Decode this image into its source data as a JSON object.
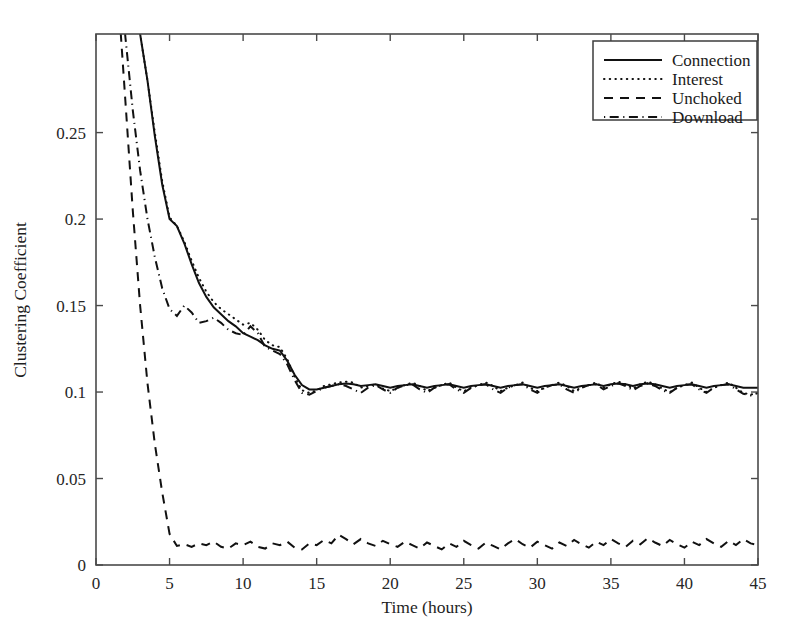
{
  "figure": {
    "background": "#ffffff",
    "ink_color": "#111111",
    "frame_color": "#4a4a4a"
  },
  "axes": {
    "x_title": "Time (hours)",
    "y_title": "Clustering Coefficient",
    "x_ticks": [
      "0",
      "5",
      "10",
      "15",
      "20",
      "25",
      "30",
      "35",
      "40",
      "45"
    ],
    "y_ticks": [
      "0",
      "0.05",
      "0.1",
      "0.15",
      "0.2",
      "0.25"
    ]
  },
  "legend": {
    "entries": [
      {
        "label": "Connection",
        "style": "solid"
      },
      {
        "label": "Interest",
        "style": "dotted"
      },
      {
        "label": "Unchoked",
        "style": "dashed"
      },
      {
        "label": "Download",
        "style": "dashdot"
      }
    ]
  },
  "chart_data": {
    "type": "line",
    "title": "",
    "xlabel": "Time (hours)",
    "ylabel": "Clustering Coefficient",
    "xlim": [
      0,
      45
    ],
    "ylim": [
      0,
      0.307
    ],
    "xticks": [
      0,
      5,
      10,
      15,
      20,
      25,
      30,
      35,
      40,
      45
    ],
    "yticks": [
      0,
      0.05,
      0.1,
      0.15,
      0.2,
      0.25
    ],
    "grid": false,
    "legend_position": "upper right",
    "x": [
      0.0,
      0.5,
      1.0,
      1.5,
      2.0,
      2.5,
      3.0,
      3.5,
      4.0,
      4.5,
      5.0,
      5.5,
      6.0,
      6.5,
      7.0,
      7.5,
      8.0,
      8.5,
      9.0,
      9.5,
      10.0,
      10.5,
      11.0,
      11.5,
      12.0,
      12.5,
      13.0,
      13.5,
      14.0,
      14.5,
      15.0,
      15.5,
      16.0,
      16.5,
      17.0,
      17.5,
      18.0,
      18.5,
      19.0,
      19.5,
      20.0,
      20.5,
      21.0,
      21.5,
      22.0,
      22.5,
      23.0,
      23.5,
      24.0,
      24.5,
      25.0,
      25.5,
      26.0,
      26.5,
      27.0,
      27.5,
      28.0,
      28.5,
      29.0,
      29.5,
      30.0,
      30.5,
      31.0,
      31.5,
      32.0,
      32.5,
      33.0,
      33.5,
      34.0,
      34.5,
      35.0,
      35.5,
      36.0,
      36.5,
      37.0,
      37.5,
      38.0,
      38.5,
      39.0,
      39.5,
      40.0,
      40.5,
      41.0,
      41.5,
      42.0,
      42.5,
      43.0,
      43.5,
      44.0,
      44.5,
      45.0
    ],
    "series": [
      {
        "name": "Connection",
        "style": "solid",
        "values": [
          0.5,
          0.46,
          0.42,
          0.385,
          0.352,
          0.33,
          0.307,
          0.28,
          0.248,
          0.22,
          0.2,
          0.196,
          0.186,
          0.174,
          0.163,
          0.155,
          0.149,
          0.145,
          0.141,
          0.138,
          0.134,
          0.132,
          0.13,
          0.127,
          0.125,
          0.124,
          0.118,
          0.11,
          0.104,
          0.1015,
          0.1015,
          0.1025,
          0.1035,
          0.1045,
          0.105,
          0.1045,
          0.1035,
          0.104,
          0.1045,
          0.1035,
          0.1025,
          0.1035,
          0.104,
          0.1045,
          0.1035,
          0.1025,
          0.1035,
          0.104,
          0.1045,
          0.1035,
          0.1025,
          0.1035,
          0.104,
          0.1045,
          0.1035,
          0.1025,
          0.1035,
          0.104,
          0.1045,
          0.1035,
          0.1025,
          0.1035,
          0.104,
          0.1045,
          0.1035,
          0.1025,
          0.1035,
          0.104,
          0.1045,
          0.1035,
          0.1045,
          0.105,
          0.1045,
          0.1035,
          0.1045,
          0.105,
          0.1045,
          0.1035,
          0.1025,
          0.1035,
          0.104,
          0.1045,
          0.1035,
          0.1025,
          0.1035,
          0.104,
          0.1045,
          0.1035,
          0.1025,
          0.1025,
          0.1025
        ]
      },
      {
        "name": "Interest",
        "style": "dotted",
        "values": [
          0.5,
          0.46,
          0.42,
          0.385,
          0.352,
          0.33,
          0.307,
          0.28,
          0.25,
          0.222,
          0.201,
          0.196,
          0.187,
          0.176,
          0.166,
          0.158,
          0.152,
          0.148,
          0.145,
          0.142,
          0.139,
          0.14,
          0.136,
          0.13,
          0.127,
          0.126,
          0.119,
          0.109,
          0.101,
          0.0995,
          0.101,
          0.1035,
          0.1045,
          0.1055,
          0.106,
          0.1055,
          0.1025,
          0.1035,
          0.1045,
          0.102,
          0.1005,
          0.1025,
          0.104,
          0.1055,
          0.1035,
          0.1005,
          0.1025,
          0.104,
          0.1055,
          0.1025,
          0.1005,
          0.1025,
          0.104,
          0.1055,
          0.1035,
          0.1005,
          0.1025,
          0.104,
          0.1055,
          0.1025,
          0.1005,
          0.1025,
          0.104,
          0.1055,
          0.1035,
          0.1005,
          0.1025,
          0.104,
          0.1055,
          0.1025,
          0.1045,
          0.106,
          0.1045,
          0.102,
          0.1045,
          0.106,
          0.1045,
          0.102,
          0.1,
          0.1025,
          0.104,
          0.1055,
          0.1025,
          0.1,
          0.1025,
          0.104,
          0.1055,
          0.1025,
          0.0995,
          0.0985,
          0.0995
        ]
      },
      {
        "name": "Unchoked",
        "style": "dashed",
        "values": [
          0.52,
          0.47,
          0.4,
          0.33,
          0.268,
          0.205,
          0.15,
          0.105,
          0.07,
          0.042,
          0.018,
          0.011,
          0.012,
          0.0105,
          0.0125,
          0.0115,
          0.0135,
          0.0105,
          0.0095,
          0.0125,
          0.0115,
          0.0135,
          0.0105,
          0.0095,
          0.0125,
          0.0115,
          0.0135,
          0.01,
          0.009,
          0.0125,
          0.0115,
          0.0145,
          0.0125,
          0.0175,
          0.015,
          0.012,
          0.015,
          0.0125,
          0.011,
          0.014,
          0.012,
          0.0105,
          0.0135,
          0.0115,
          0.0095,
          0.013,
          0.011,
          0.009,
          0.0125,
          0.0105,
          0.014,
          0.0115,
          0.0095,
          0.013,
          0.011,
          0.009,
          0.0125,
          0.015,
          0.012,
          0.01,
          0.0135,
          0.0115,
          0.0095,
          0.013,
          0.011,
          0.0145,
          0.012,
          0.01,
          0.0135,
          0.0115,
          0.015,
          0.0125,
          0.0105,
          0.014,
          0.012,
          0.0155,
          0.013,
          0.011,
          0.0145,
          0.012,
          0.01,
          0.0135,
          0.0115,
          0.015,
          0.0125,
          0.0105,
          0.014,
          0.0115,
          0.015,
          0.0125,
          0.0115
        ]
      },
      {
        "name": "Download",
        "style": "dashdot",
        "values": [
          0.51,
          0.465,
          0.41,
          0.355,
          0.305,
          0.263,
          0.228,
          0.2,
          0.178,
          0.16,
          0.148,
          0.144,
          0.15,
          0.146,
          0.14,
          0.141,
          0.143,
          0.14,
          0.136,
          0.134,
          0.133,
          0.138,
          0.134,
          0.126,
          0.124,
          0.122,
          0.116,
          0.107,
          0.0995,
          0.0985,
          0.1005,
          0.1025,
          0.1035,
          0.1045,
          0.1035,
          0.1015,
          0.0995,
          0.1025,
          0.104,
          0.1015,
          0.0995,
          0.1025,
          0.104,
          0.1045,
          0.1015,
          0.0995,
          0.1025,
          0.104,
          0.1045,
          0.1015,
          0.0995,
          0.1025,
          0.104,
          0.1045,
          0.1015,
          0.0995,
          0.1025,
          0.104,
          0.1045,
          0.1015,
          0.0995,
          0.1025,
          0.104,
          0.1045,
          0.1015,
          0.0995,
          0.1025,
          0.104,
          0.1045,
          0.1015,
          0.1035,
          0.105,
          0.1035,
          0.101,
          0.1035,
          0.105,
          0.1035,
          0.101,
          0.0995,
          0.1025,
          0.104,
          0.1045,
          0.1015,
          0.0995,
          0.1025,
          0.104,
          0.1045,
          0.1015,
          0.099,
          0.098,
          0.0995
        ]
      }
    ]
  }
}
